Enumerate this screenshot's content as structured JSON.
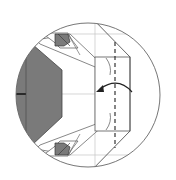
{
  "diagram": {
    "type": "origami-step-detail",
    "view": "circular-zoom-inset",
    "elements": {
      "fold_line": "dashed-valley-fold",
      "arrow": "curved-fold-arrow-left",
      "shaded_regions": [
        "hexagon-back-layer",
        "top-corner-flap",
        "bottom-corner-flap"
      ]
    },
    "colors": {
      "outline": "#555555",
      "shade": "#7a7a7a",
      "guide": "#bdbdbd",
      "background": "#ffffff"
    },
    "labels": []
  }
}
